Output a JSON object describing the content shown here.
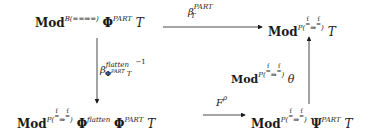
{
  "diagram": {
    "type": "commutative-diagram",
    "nodes": {
      "top_left": {
        "base": "Mod",
        "sup": "B(==⇒=)",
        "phi": "Φ",
        "phi_sup": "PART",
        "tail": "T"
      },
      "top_right": {
        "base": "Mod",
        "sup_prefix": "P(",
        "frac_top": "f",
        "arrow": "⇒",
        "frac_top2": "f",
        "sup_suffix": ")",
        "tail": "T"
      },
      "bottom_left": {
        "base": "Mod",
        "sup_prefix": "P(",
        "frac_top": "f",
        "arrow": "⇒",
        "frac_top2": "f",
        "sup_suffix": ")",
        "phi1": "Φ",
        "phi1_sup": "flatten",
        "phi2": "Φ",
        "phi2_sup": "PART",
        "tail": "T"
      },
      "bottom_right": {
        "base": "Mod",
        "sup_prefix": "P(",
        "frac_top": "f",
        "arrow": "⇒",
        "frac_top2": "f",
        "sup_suffix": ")",
        "psi": "Ψ",
        "psi_sup": "PART",
        "tail": "T"
      }
    },
    "edges": {
      "top": {
        "beta": "β",
        "sup": "PART",
        "sub": "T"
      },
      "left": {
        "beta": "β",
        "sup": "flatten",
        "sub": "Φ",
        "sub_sup": "PART",
        "sub_tail": "T",
        "inverse": "−1"
      },
      "right": {
        "base": "Mod",
        "sup_prefix": "P(",
        "frac_top": "f",
        "arrow": "⇒",
        "frac_top2": "f",
        "sup_suffix": ")",
        "tail": "θ"
      },
      "bottom": {
        "F": "F",
        "sup": "ρ"
      }
    }
  }
}
